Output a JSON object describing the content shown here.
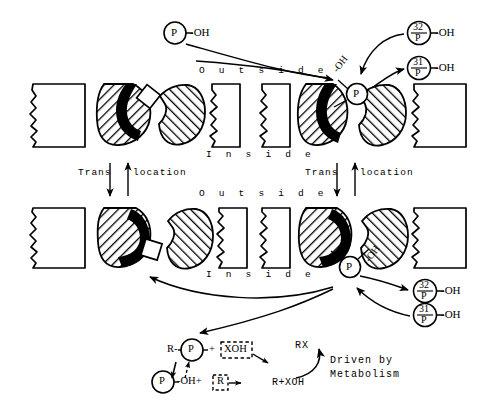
{
  "diagram": {
    "colors": {
      "ink": "#000000",
      "paper": "#ffffff",
      "hatch": "#000000",
      "cap": "#000000"
    }
  },
  "labels": {
    "outside": "O u t s i d e",
    "inside": "I n s i d e",
    "trans": "Trans",
    "location": "location",
    "p": "P",
    "oh_suffix": "-OH",
    "oh_tag": "-OH",
    "iso32": "32",
    "iso31": "31",
    "rx": "RX",
    "r_plus_xoh": "R+XOH",
    "driven_line1": "Driven by",
    "driven_line2": "Metabolism",
    "r_prefix": "R-",
    "plus": "+",
    "xoh_box": "XOH",
    "oh_plus": "-OH+",
    "r_box": "R"
  },
  "panels": [
    {
      "id": "top-left",
      "state": "loaded-empty-site",
      "membrane_sides": [
        "outside",
        "inside"
      ]
    },
    {
      "id": "top-right",
      "state": "phosphate-bound",
      "membrane_sides": [
        "outside",
        "inside"
      ]
    },
    {
      "id": "bottom-left",
      "state": "substrate-in-site",
      "membrane_sides": [
        "outside",
        "inside"
      ]
    },
    {
      "id": "bottom-right",
      "state": "phosphate-released",
      "membrane_sides": [
        "outside",
        "inside"
      ]
    }
  ],
  "species": {
    "free_phosphate": "P",
    "radio_phosphate": "32P",
    "cold_phosphate": "31P",
    "carrier_hydroxyl": "-OH"
  }
}
